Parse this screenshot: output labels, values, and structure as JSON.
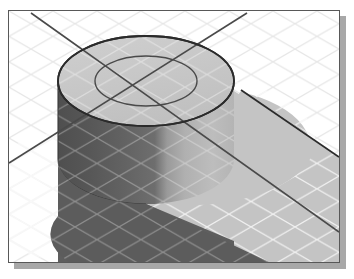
{
  "window": {
    "title": "Isometric 3D Shaded View",
    "frame": {
      "x": 8,
      "y": 10,
      "width": 332,
      "height": 253,
      "border_color": "#585858",
      "background_color": "#ffffff",
      "shadow_color": "#a8a8a8",
      "shadow_offset_x": 6,
      "shadow_offset_y": 6
    }
  },
  "scene": {
    "name": "cad-isometric-viewport",
    "projection": "isometric",
    "background_color": "#ffffff",
    "grid": {
      "visible": true,
      "type": "isometric-diamond",
      "color": "#e6e6e6",
      "line_width": 1.1,
      "spacing_px": 25,
      "angle_degrees": 30
    },
    "construction_lines": {
      "visible": true,
      "color": "#4a4a4a",
      "line_width": 1.6,
      "count": 2,
      "lines": [
        {
          "name": "axis-line-primary",
          "x1": 22,
          "y1": 2,
          "x2": 330,
          "y2": 221
        },
        {
          "name": "axis-line-secondary",
          "x1": 0,
          "y1": 152,
          "x2": 238,
          "y2": 2
        }
      ]
    },
    "solid": {
      "name": "cylinder-with-counterbore",
      "type": "cylinder",
      "top_face": {
        "name": "cylinder-top-face",
        "shape": "ellipse",
        "center_x": 137,
        "center_y": 70,
        "radius_x": 88,
        "radius_y": 45,
        "fill_color": "#c9c9c9",
        "edge_color": "#2b2b2b",
        "edge_width": 1.8
      },
      "inner_circle": {
        "name": "counterbore-ellipse",
        "shape": "ellipse",
        "center_x": 137,
        "center_y": 70,
        "radius_x": 51,
        "radius_y": 25,
        "fill_color": "none",
        "edge_color": "#4a4a4a",
        "edge_width": 1.4
      },
      "body": {
        "name": "cylinder-side-wall",
        "height_px": 120,
        "shading": "gradient",
        "fill_left_color": "#5c5c5c",
        "fill_mid_color": "#6e6e6e",
        "fill_right_color": "#bdbdbd",
        "bottom_center_y": 190
      }
    },
    "shadow": {
      "name": "cast-shadow-band",
      "visible": true,
      "fill_color": "#c2c2c2",
      "edge_color": "#2b2b2b",
      "edge_width": 1.6,
      "direction": "lower-right"
    }
  },
  "colors": {
    "white": "#ffffff",
    "grid_line": "#e6e6e6",
    "top_face": "#c9c9c9",
    "wall_dark": "#5c5c5c",
    "wall_light": "#bdbdbd",
    "shadow_band": "#c2c2c2",
    "outline": "#2b2b2b",
    "frame_border": "#585858",
    "frame_shadow": "#a8a8a8"
  }
}
